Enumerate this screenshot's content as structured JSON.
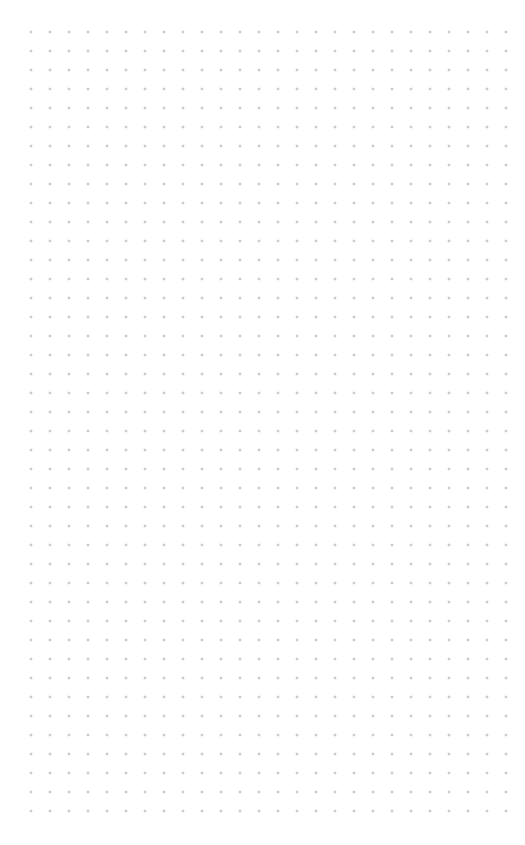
{
  "canvas": {
    "type": "dot-grid",
    "background_color": "#ffffff",
    "dot_color": "#a8a8a8",
    "dot_spacing_px": 19,
    "columns": 26,
    "rows": 42
  }
}
